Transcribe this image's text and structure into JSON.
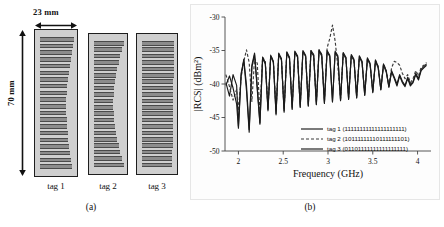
{
  "panel_a": {
    "name": "tag-geometry-panel",
    "caption": "(a)",
    "width_label": "23 mm",
    "height_label": "70 mm",
    "tags": [
      {
        "label": "tag 1",
        "bar_count": 20,
        "taper": "slight-left-curve"
      },
      {
        "label": "tag 2",
        "bar_count": 20,
        "taper": "concave"
      },
      {
        "label": "tag 3",
        "bar_count": 20,
        "taper": "uniform"
      }
    ]
  },
  "panel_b": {
    "name": "rcs-spectrum-panel",
    "caption": "(b)",
    "legend": [
      {
        "label": "tag 1 (11111111111111111111)",
        "style": "solid",
        "color": "#1a1a1a"
      },
      {
        "label": "tag 2 (10111111110111111101)",
        "style": "dashed",
        "color": "#3a3a3a"
      },
      {
        "label": "tag 3 (01101111111111111111)",
        "style": "solid",
        "color": "#1a1a1a"
      }
    ]
  },
  "chart_data": {
    "type": "line",
    "title": "",
    "xlabel": "Frequency (GHz)",
    "ylabel": "|RCS| (dBm²)",
    "xlim": [
      1.85,
      4.15
    ],
    "ylim": [
      -50,
      -30
    ],
    "xticks": [
      2,
      2.5,
      3,
      3.5,
      4
    ],
    "xticklabels": [
      "2",
      "2.5",
      "3",
      "3.5",
      "4"
    ],
    "yticks": [
      -30,
      -35,
      -40,
      -45,
      -50
    ],
    "yticklabels": [
      "-30",
      "-35",
      "-40",
      "-45",
      "-50"
    ],
    "grid": false,
    "legend_position": "lower-center",
    "series": [
      {
        "name": "tag 1 (11111111111111111111)",
        "style": "solid",
        "color": "#1a1a1a",
        "x": [
          1.86,
          1.9,
          1.94,
          1.98,
          2.0,
          2.03,
          2.06,
          2.09,
          2.12,
          2.15,
          2.18,
          2.21,
          2.24,
          2.27,
          2.3,
          2.33,
          2.36,
          2.39,
          2.42,
          2.45,
          2.48,
          2.51,
          2.54,
          2.57,
          2.6,
          2.63,
          2.66,
          2.69,
          2.72,
          2.75,
          2.78,
          2.81,
          2.84,
          2.87,
          2.9,
          2.93,
          2.96,
          2.99,
          3.02,
          3.05,
          3.08,
          3.11,
          3.14,
          3.17,
          3.2,
          3.23,
          3.26,
          3.29,
          3.32,
          3.35,
          3.38,
          3.41,
          3.44,
          3.47,
          3.5,
          3.53,
          3.56,
          3.59,
          3.62,
          3.65,
          3.68,
          3.71,
          3.74,
          3.77,
          3.8,
          3.83,
          3.86,
          3.89,
          3.92,
          3.95,
          3.98,
          4.01,
          4.04,
          4.07,
          4.1
        ],
        "y": [
          -39.8,
          -41.8,
          -38.6,
          -40.2,
          -46.3,
          -38.4,
          -36.5,
          -41.0,
          -47.2,
          -37.5,
          -35.6,
          -40.8,
          -46.0,
          -36.2,
          -37.0,
          -43.8,
          -35.9,
          -36.8,
          -44.4,
          -35.6,
          -36.4,
          -44.0,
          -35.4,
          -36.2,
          -43.6,
          -35.3,
          -36.0,
          -43.4,
          -35.2,
          -35.9,
          -43.2,
          -35.2,
          -35.8,
          -43.0,
          -35.1,
          -35.8,
          -42.8,
          -35.2,
          -35.9,
          -42.6,
          -35.3,
          -36.0,
          -42.4,
          -35.5,
          -36.2,
          -42.2,
          -35.8,
          -36.5,
          -42.0,
          -36.0,
          -36.8,
          -41.6,
          -36.3,
          -37.1,
          -41.2,
          -36.6,
          -37.6,
          -40.8,
          -37.2,
          -38.2,
          -40.4,
          -38.0,
          -39.0,
          -40.0,
          -38.6,
          -39.6,
          -40.2,
          -39.0,
          -40.1,
          -39.6,
          -38.4,
          -39.2,
          -37.8,
          -37.4,
          -37.0
        ]
      },
      {
        "name": "tag 2 (10111111110111111101)",
        "style": "dashed",
        "color": "#3a3a3a",
        "x": [
          1.86,
          1.9,
          1.94,
          1.98,
          2.0,
          2.03,
          2.06,
          2.09,
          2.12,
          2.15,
          2.18,
          2.21,
          2.24,
          2.27,
          2.3,
          2.33,
          2.36,
          2.39,
          2.42,
          2.45,
          2.48,
          2.51,
          2.54,
          2.57,
          2.6,
          2.63,
          2.66,
          2.69,
          2.72,
          2.75,
          2.78,
          2.81,
          2.84,
          2.87,
          2.9,
          2.93,
          2.96,
          2.99,
          3.02,
          3.05,
          3.08,
          3.11,
          3.14,
          3.17,
          3.2,
          3.23,
          3.26,
          3.29,
          3.32,
          3.35,
          3.38,
          3.41,
          3.44,
          3.47,
          3.5,
          3.53,
          3.56,
          3.59,
          3.62,
          3.65,
          3.68,
          3.71,
          3.74,
          3.77,
          3.8,
          3.83,
          3.86,
          3.89,
          3.92,
          3.95,
          3.98,
          4.01,
          4.04,
          4.07,
          4.1
        ],
        "y": [
          -38.6,
          -40.4,
          -42.4,
          -40.8,
          -44.0,
          -39.0,
          -36.6,
          -34.9,
          -36.8,
          -42.6,
          -36.2,
          -36.9,
          -44.2,
          -36.0,
          -36.6,
          -43.6,
          -35.8,
          -36.5,
          -44.0,
          -35.5,
          -36.3,
          -43.8,
          -35.3,
          -36.1,
          -43.4,
          -35.2,
          -35.9,
          -43.2,
          -35.1,
          -35.8,
          -43.0,
          -35.0,
          -35.7,
          -42.8,
          -34.9,
          -35.6,
          -42.6,
          -34.6,
          -33.2,
          -31.2,
          -33.6,
          -37.4,
          -42.2,
          -35.4,
          -36.1,
          -42.0,
          -35.7,
          -36.4,
          -41.8,
          -35.9,
          -36.7,
          -41.4,
          -36.2,
          -37.0,
          -41.0,
          -36.5,
          -37.4,
          -40.6,
          -37.0,
          -38.0,
          -40.2,
          -37.6,
          -36.6,
          -36.8,
          -37.2,
          -38.4,
          -39.2,
          -38.6,
          -39.8,
          -39.2,
          -38.0,
          -38.8,
          -37.5,
          -37.2,
          -36.8
        ]
      },
      {
        "name": "tag 3 (01101111111111111111)",
        "style": "solid",
        "color": "#1a1a1a",
        "x": [
          1.86,
          1.9,
          1.94,
          1.98,
          2.0,
          2.03,
          2.06,
          2.09,
          2.12,
          2.15,
          2.18,
          2.21,
          2.24,
          2.27,
          2.3,
          2.33,
          2.36,
          2.39,
          2.42,
          2.45,
          2.48,
          2.51,
          2.54,
          2.57,
          2.6,
          2.63,
          2.66,
          2.69,
          2.72,
          2.75,
          2.78,
          2.81,
          2.84,
          2.87,
          2.9,
          2.93,
          2.96,
          2.99,
          3.02,
          3.05,
          3.08,
          3.11,
          3.14,
          3.17,
          3.2,
          3.23,
          3.26,
          3.29,
          3.32,
          3.35,
          3.38,
          3.41,
          3.44,
          3.47,
          3.5,
          3.53,
          3.56,
          3.59,
          3.62,
          3.65,
          3.68,
          3.71,
          3.74,
          3.77,
          3.8,
          3.83,
          3.86,
          3.89,
          3.92,
          3.95,
          3.98,
          4.01,
          4.04,
          4.07,
          4.1
        ],
        "y": [
          -40.2,
          -38.8,
          -40.6,
          -43.0,
          -46.6,
          -38.8,
          -36.3,
          -40.2,
          -46.8,
          -37.2,
          -35.4,
          -40.4,
          -45.8,
          -36.0,
          -36.8,
          -44.0,
          -35.7,
          -36.6,
          -44.6,
          -35.4,
          -36.2,
          -44.2,
          -35.2,
          -36.0,
          -43.8,
          -35.1,
          -35.8,
          -43.5,
          -35.0,
          -35.7,
          -43.3,
          -35.0,
          -35.6,
          -43.1,
          -34.9,
          -35.6,
          -42.9,
          -35.0,
          -35.7,
          -42.7,
          -35.1,
          -35.8,
          -42.5,
          -35.3,
          -36.0,
          -42.3,
          -35.6,
          -36.3,
          -42.1,
          -35.8,
          -36.6,
          -41.7,
          -36.1,
          -36.9,
          -41.3,
          -36.4,
          -37.4,
          -40.9,
          -37.0,
          -38.0,
          -40.5,
          -38.2,
          -39.2,
          -40.3,
          -38.8,
          -39.8,
          -40.4,
          -39.2,
          -40.3,
          -39.8,
          -38.6,
          -39.4,
          -38.0,
          -37.6,
          -37.2
        ]
      }
    ]
  }
}
